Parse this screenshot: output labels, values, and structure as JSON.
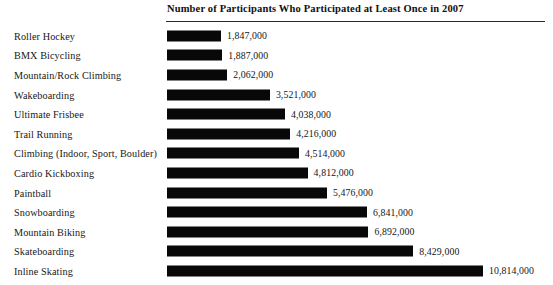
{
  "chart_data": {
    "type": "bar",
    "orientation": "horizontal",
    "title": "Number of Participants Who Participated at Least Once in 2007",
    "xlabel": "",
    "ylabel": "",
    "grid": false,
    "legend": null,
    "xlim": [
      0,
      10814000
    ],
    "categories": [
      "Roller Hockey",
      "BMX Bicycling",
      "Mountain/Rock Climbing",
      "Wakeboarding",
      "Ultimate Frisbee",
      "Trail Running",
      "Climbing (Indoor, Sport, Boulder)",
      "Cardio Kickboxing",
      "Paintball",
      "Snowboarding",
      "Mountain Biking",
      "Skateboarding",
      "Inline Skating"
    ],
    "values": [
      1847000,
      1887000,
      2062000,
      3521000,
      4038000,
      4216000,
      4514000,
      4812000,
      5476000,
      6841000,
      6892000,
      8429000,
      10814000
    ],
    "value_labels": [
      "1,847,000",
      "1,887,000",
      "2,062,000",
      "3,521,000",
      "4,038,000",
      "4,216,000",
      "4,514,000",
      "4,812,000",
      "5,476,000",
      "6,841,000",
      "6,892,000",
      "8,429,000",
      "10,814,000"
    ],
    "bar_color": "#080808",
    "background_color": "#ffffff"
  },
  "rows": [
    {
      "label": "Roller Hockey",
      "value_label": "1,847,000"
    },
    {
      "label": "BMX Bicycling",
      "value_label": "1,887,000"
    },
    {
      "label": "Mountain/Rock Climbing",
      "value_label": "2,062,000"
    },
    {
      "label": "Wakeboarding",
      "value_label": "3,521,000"
    },
    {
      "label": "Ultimate Frisbee",
      "value_label": "4,038,000"
    },
    {
      "label": "Trail Running",
      "value_label": "4,216,000"
    },
    {
      "label": "Climbing (Indoor, Sport, Boulder)",
      "value_label": "4,514,000"
    },
    {
      "label": "Cardio Kickboxing",
      "value_label": "4,812,000"
    },
    {
      "label": "Paintball",
      "value_label": "5,476,000"
    },
    {
      "label": "Snowboarding",
      "value_label": "6,841,000"
    },
    {
      "label": "Mountain Biking",
      "value_label": "6,892,000"
    },
    {
      "label": "Skateboarding",
      "value_label": "8,429,000"
    },
    {
      "label": "Inline Skating",
      "value_label": "10,814,000"
    }
  ]
}
